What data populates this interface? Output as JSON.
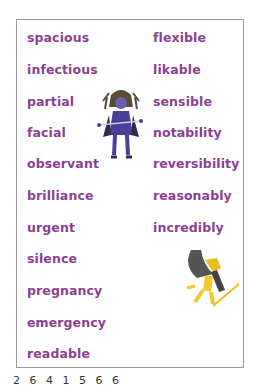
{
  "word_list": {
    "left_column": [
      "spacious",
      "infectious",
      "partial",
      "facial",
      "observant",
      "brilliance",
      "urgent",
      "silence",
      "pregnancy",
      "emergency",
      "readable"
    ],
    "right_column": [
      "flexible",
      "likable",
      "sensible",
      "notability",
      "reversibility",
      "reasonably",
      "incredibly"
    ]
  },
  "illustrations": [
    "witch-character",
    "running-character"
  ],
  "footer": {
    "text": "2 6 4   1 5 6 6"
  },
  "colors": {
    "text": "#8a3f92",
    "border": "#9a9a9a"
  }
}
